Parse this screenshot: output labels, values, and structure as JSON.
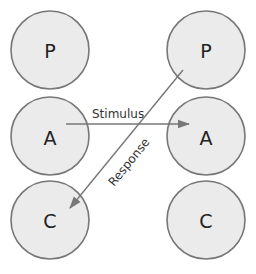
{
  "diagram": {
    "type": "transactional-analysis",
    "left_column": {
      "nodes": [
        {
          "id": "L-P",
          "label": "P"
        },
        {
          "id": "L-A",
          "label": "A"
        },
        {
          "id": "L-C",
          "label": "C"
        }
      ]
    },
    "right_column": {
      "nodes": [
        {
          "id": "R-P",
          "label": "P"
        },
        {
          "id": "R-A",
          "label": "A"
        },
        {
          "id": "R-C",
          "label": "C"
        }
      ]
    },
    "edges": [
      {
        "from": "L-A",
        "to": "R-A",
        "label": "Stimulus"
      },
      {
        "from": "R-P",
        "to": "L-C",
        "label": "Response"
      }
    ],
    "colors": {
      "node_fill": "#ebebeb",
      "node_stroke": "#777777",
      "edge": "#777777"
    }
  }
}
